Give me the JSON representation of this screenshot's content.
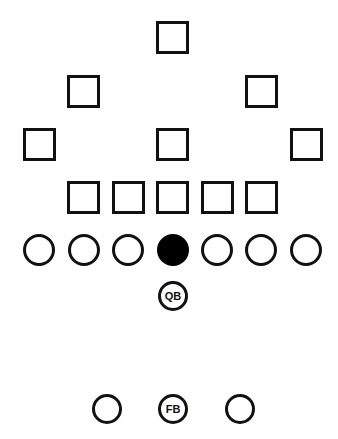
{
  "diagram": {
    "type": "football-formation",
    "colors": {
      "stroke": "#111111",
      "fill": "#ffffff",
      "center_fill": "#000000"
    },
    "defense": {
      "symbol": "square",
      "size": 33,
      "players": [
        {
          "x": 156,
          "y": 21
        },
        {
          "x": 67,
          "y": 75
        },
        {
          "x": 245,
          "y": 75
        },
        {
          "x": 23,
          "y": 128
        },
        {
          "x": 156,
          "y": 128
        },
        {
          "x": 290,
          "y": 128
        },
        {
          "x": 67,
          "y": 181
        },
        {
          "x": 112,
          "y": 181
        },
        {
          "x": 156,
          "y": 181
        },
        {
          "x": 201,
          "y": 181
        },
        {
          "x": 245,
          "y": 181
        }
      ]
    },
    "offense": {
      "symbol": "circle",
      "line": [
        {
          "cx": 39,
          "cy": 250,
          "r": 16,
          "label": ""
        },
        {
          "cx": 84,
          "cy": 250,
          "r": 16,
          "label": ""
        },
        {
          "cx": 128,
          "cy": 250,
          "r": 16,
          "label": ""
        },
        {
          "cx": 173,
          "cy": 250,
          "r": 16,
          "label": "",
          "filled": true
        },
        {
          "cx": 217,
          "cy": 250,
          "r": 16,
          "label": ""
        },
        {
          "cx": 261,
          "cy": 250,
          "r": 16,
          "label": ""
        },
        {
          "cx": 306,
          "cy": 250,
          "r": 16,
          "label": ""
        }
      ],
      "backs": [
        {
          "cx": 173,
          "cy": 296,
          "r": 15,
          "label": "QB"
        },
        {
          "cx": 107,
          "cy": 409,
          "r": 15,
          "label": ""
        },
        {
          "cx": 173,
          "cy": 409,
          "r": 15,
          "label": "FB"
        },
        {
          "cx": 240,
          "cy": 409,
          "r": 15,
          "label": ""
        }
      ]
    }
  }
}
